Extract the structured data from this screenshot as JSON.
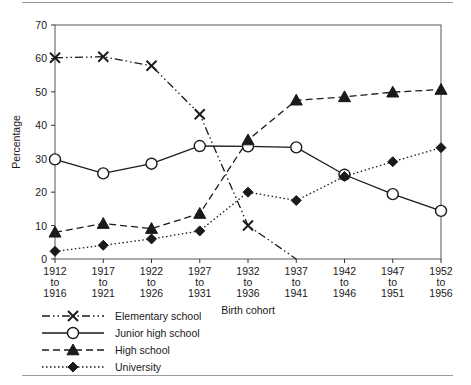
{
  "chart_data": {
    "type": "line",
    "title": "",
    "xlabel": "Birth cohort",
    "ylabel": "Percentage",
    "ylim": [
      0,
      70
    ],
    "ytick_step": 10,
    "yticks": [
      "0",
      "10",
      "20",
      "30",
      "40",
      "50",
      "60",
      "70"
    ],
    "grid": false,
    "legend_position": "below-left",
    "categories": [
      "1912\nto\n1916",
      "1917\nto\n1921",
      "1922\nto\n1926",
      "1927\nto\n1931",
      "1932\nto\n1936",
      "1937\nto\n1941",
      "1942\nto\n1946",
      "1947\nto\n1951",
      "1952\nto\n1956"
    ],
    "category_lines": [
      [
        "1912",
        "to",
        "1916"
      ],
      [
        "1917",
        "to",
        "1921"
      ],
      [
        "1922",
        "to",
        "1926"
      ],
      [
        "1927",
        "to",
        "1931"
      ],
      [
        "1932",
        "to",
        "1936"
      ],
      [
        "1937",
        "to",
        "1941"
      ],
      [
        "1942",
        "to",
        "1946"
      ],
      [
        "1947",
        "to",
        "1951"
      ],
      [
        "1952",
        "to",
        "1956"
      ]
    ],
    "series": [
      {
        "name": "Elementary school",
        "marker": "x",
        "linestyle": "dashdot",
        "color": "#1a1a1a",
        "values": [
          60.2,
          60.5,
          57.8,
          43.3,
          10.0,
          0.0,
          null,
          null,
          null
        ]
      },
      {
        "name": "Junior high school",
        "marker": "circle-open",
        "linestyle": "solid",
        "color": "#1a1a1a",
        "values": [
          29.8,
          25.6,
          28.5,
          33.8,
          33.7,
          33.4,
          25.2,
          19.4,
          14.4
        ]
      },
      {
        "name": "High school",
        "marker": "triangle-filled",
        "linestyle": "dashed",
        "color": "#1a1a1a",
        "values": [
          8.0,
          10.6,
          9.1,
          13.6,
          35.6,
          47.5,
          48.5,
          49.9,
          50.7
        ]
      },
      {
        "name": "University",
        "marker": "diamond-filled",
        "linestyle": "dotted",
        "color": "#1a1a1a",
        "values": [
          2.3,
          4.1,
          6.0,
          8.4,
          20.0,
          17.5,
          24.7,
          29.1,
          33.3
        ]
      }
    ]
  },
  "legend": {
    "items": [
      {
        "label": "Elementary school"
      },
      {
        "label": "Junior high school"
      },
      {
        "label": "High school"
      },
      {
        "label": "University"
      }
    ]
  }
}
